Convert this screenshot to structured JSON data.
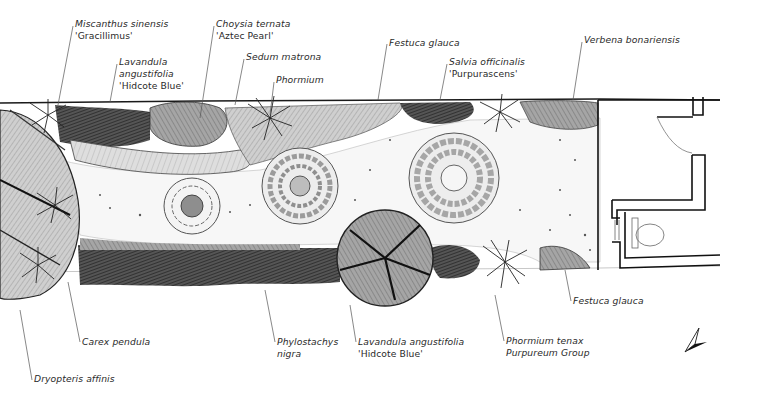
{
  "colors": {
    "background": "#ffffff",
    "ink": "#1a1a1a",
    "label_text": "#2a2a2a",
    "leader_line": "#555555",
    "dark_planting": "#2b2b2b",
    "mid_planting": "#8a8a8a",
    "light_planting": "#c4c4c4",
    "gravel": "#f2f2f2"
  },
  "labels": [
    {
      "id": "miscanthus",
      "species": "Miscanthus sinensis",
      "cultivar": "'Gracillimus'",
      "x": 75,
      "y": 18
    },
    {
      "id": "lavandula-top",
      "species": "Lavandula",
      "species2": "angustifolia",
      "cultivar": "'Hidcote Blue'",
      "x": 119,
      "y": 56
    },
    {
      "id": "choysia",
      "species": "Choysia ternata",
      "cultivar": "'Aztec Pearl'",
      "x": 216,
      "y": 18
    },
    {
      "id": "sedum",
      "species": "Sedum matrona",
      "x": 246,
      "y": 51
    },
    {
      "id": "phormium",
      "species": "Phormium",
      "x": 276,
      "y": 74
    },
    {
      "id": "festuca-top",
      "species": "Festuca glauca",
      "x": 389,
      "y": 38
    },
    {
      "id": "salvia",
      "species": "Salvia officinalis",
      "cultivar": "'Purpurascens'",
      "x": 449,
      "y": 56
    },
    {
      "id": "verbena",
      "species": "Verbena bonariensis",
      "x": 584,
      "y": 35
    },
    {
      "id": "carex",
      "species": "Carex pendula",
      "x": 82,
      "y": 336
    },
    {
      "id": "dryopteris",
      "species": "Dryopteris affinis",
      "x": 34,
      "y": 374
    },
    {
      "id": "phylostachys",
      "species": "Phylostachys",
      "cultivar_italic": "nigra",
      "x": 277,
      "y": 336
    },
    {
      "id": "lavandula-bottom",
      "species": "Lavandula angustifolia",
      "cultivar": "'Hidcote Blue'",
      "x": 358,
      "y": 336
    },
    {
      "id": "phormium-tenax",
      "species": "Phormium tenax",
      "cultivar_italic": "Purpureum Group",
      "x": 506,
      "y": 335
    },
    {
      "id": "festuca-bottom",
      "species": "Festuca glauca",
      "x": 573,
      "y": 295
    }
  ],
  "features": {
    "paving_circles": 3,
    "north_arrow": "north-arrow",
    "building": "outbuilding-with-wc"
  }
}
